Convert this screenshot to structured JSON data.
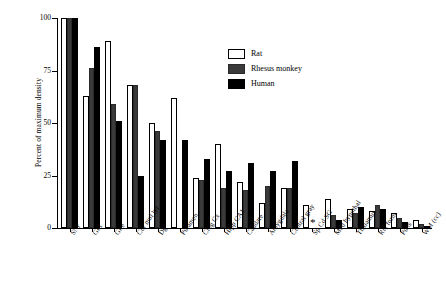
{
  "chart_data": {
    "type": "bar",
    "title": "",
    "xlabel": "",
    "ylabel": "Percent of maximum density",
    "ylim": [
      0,
      100
    ],
    "yticks": [
      0,
      25,
      50,
      75,
      100
    ],
    "grid": false,
    "legend_position": "top-right",
    "categories": [
      "SNr",
      "GPi",
      "GPe",
      "Cor mol lyr",
      "Dg",
      "Putamen",
      "Cing Cx",
      "Hipp CA1",
      "Caudate",
      "Amygdala",
      "Central gray",
      "Sp Cd SG",
      "Med hypothal",
      "Thalamus",
      "Ret form",
      "Pons",
      "WM (cc)"
    ],
    "series": [
      {
        "name": "Rat",
        "color": "#ffffff",
        "values": [
          100,
          63,
          89,
          68,
          50,
          62,
          24,
          40,
          22,
          12,
          19,
          11,
          14,
          9,
          8,
          7,
          4
        ]
      },
      {
        "name": "Rhesus monkey",
        "color": "#3a3a3a",
        "values": [
          100,
          76,
          59,
          68,
          46,
          null,
          23,
          19,
          18,
          20,
          19,
          null,
          6,
          7,
          11,
          5,
          2
        ]
      },
      {
        "name": "Human",
        "color": "#000000",
        "values": [
          100,
          86,
          51,
          25,
          42,
          42,
          33,
          27,
          31,
          27,
          32,
          null,
          4,
          10,
          9,
          3,
          1
        ]
      }
    ],
    "annotations": [
      {
        "text": "*",
        "category": "Sp Cd SG",
        "note": "asterisk marker in place of rhesus/human bars"
      }
    ]
  },
  "legend": {
    "items": [
      {
        "label": "Rat"
      },
      {
        "label": "Rhesus monkey"
      },
      {
        "label": "Human"
      }
    ]
  },
  "axis": {
    "y_title": "Percent of maximum density",
    "y_tick_labels": [
      "100",
      "75",
      "50",
      "25",
      "0"
    ]
  }
}
